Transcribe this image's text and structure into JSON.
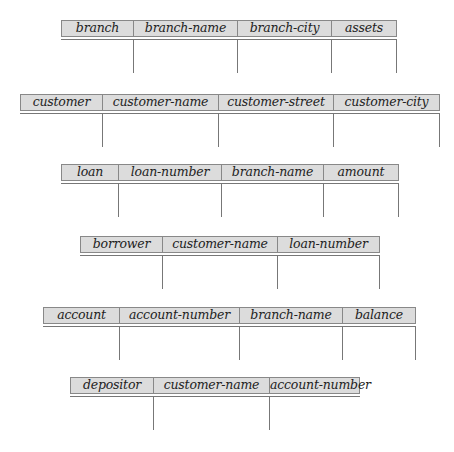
{
  "schemas": [
    {
      "name": "branch",
      "attributes": [
        "branch-name",
        "branch-city",
        "assets"
      ]
    },
    {
      "name": "customer",
      "attributes": [
        "customer-name",
        "customer-street",
        "customer-city"
      ]
    },
    {
      "name": "loan",
      "attributes": [
        "loan-number",
        "branch-name",
        "amount"
      ]
    },
    {
      "name": "borrower",
      "attributes": [
        "customer-name",
        "loan-number"
      ]
    },
    {
      "name": "account",
      "attributes": [
        "account-number",
        "branch-name",
        "balance"
      ]
    },
    {
      "name": "depositor",
      "attributes": [
        "customer-name",
        "account-number"
      ]
    }
  ]
}
